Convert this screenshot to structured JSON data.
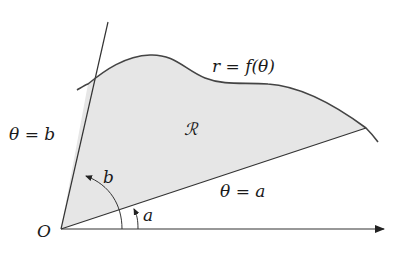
{
  "diagram": {
    "labels": {
      "curve": "r = f(θ)",
      "region": "ℛ",
      "ray_b": "θ = b",
      "ray_a": "θ = a",
      "angle_b": "b",
      "angle_a": "a",
      "origin": "O"
    },
    "colors": {
      "region_fill": "#e6e6e6",
      "stroke": "#333333",
      "text": "#1a1a1a",
      "background": "#ffffff"
    },
    "geometry": {
      "origin": [
        61,
        229
      ],
      "polar_axis_end": [
        384,
        229
      ],
      "ray_b_end": [
        108,
        22
      ],
      "ray_a_end": [
        366,
        128
      ],
      "curve_start": [
        77,
        90
      ],
      "curve_end": [
        378,
        142
      ]
    }
  }
}
